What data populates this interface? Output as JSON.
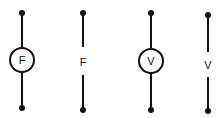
{
  "diagram": {
    "stroke_color": "#111111",
    "symbols": [
      {
        "id": "ammeter-symbol",
        "label": "F",
        "x": 22,
        "circle": true
      },
      {
        "id": "force-line-symbol",
        "label": "F",
        "x": 83,
        "circle": false
      },
      {
        "id": "voltmeter-symbol",
        "label": "V",
        "x": 151,
        "circle": true
      },
      {
        "id": "voltage-line-symbol",
        "label": "V",
        "x": 208,
        "circle": false
      }
    ]
  }
}
